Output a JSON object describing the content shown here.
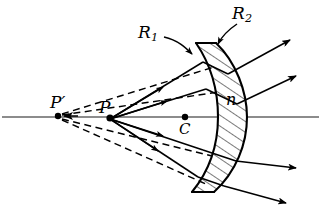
{
  "figure": {
    "background_color": "#ffffff",
    "ink_color": "#000000",
    "axis_color": "#555555",
    "width": 321,
    "height": 207
  },
  "labels": {
    "r1": {
      "text": "R",
      "subscript": "1",
      "name": "first-surface-radius"
    },
    "r2": {
      "text": "R",
      "subscript": "2",
      "name": "second-surface-radius"
    },
    "p_prime": {
      "text": "P′",
      "name": "virtual-image-point"
    },
    "p": {
      "text": "P",
      "name": "object-point"
    },
    "c": {
      "text": "C",
      "name": "center-of-curvature"
    },
    "n": {
      "text": "n",
      "name": "refractive-index"
    }
  },
  "points": {
    "p_prime": {
      "x": 58,
      "y": 116
    },
    "p": {
      "x": 110,
      "y": 119
    },
    "c": {
      "x": 185,
      "y": 117
    }
  },
  "optical_axis": {
    "y": 117,
    "x_start": 2,
    "x_end": 319
  },
  "lens": {
    "type": "meniscus",
    "hatched": true,
    "front_surface_label": "R1",
    "back_surface_label": "R2",
    "top_y": 43,
    "bottom_y": 192
  },
  "rays": {
    "solid_label": "refracted ray",
    "dashed_label": "virtual ray extension",
    "incident_count": 4,
    "exit_count": 4
  }
}
